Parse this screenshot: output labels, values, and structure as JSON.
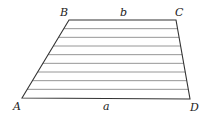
{
  "diagram": {
    "type": "trapezoid",
    "vertices": {
      "A": {
        "label": "A",
        "x": 22,
        "y": 98
      },
      "B": {
        "label": "B",
        "x": 69,
        "y": 20
      },
      "C": {
        "label": "C",
        "x": 176,
        "y": 20
      },
      "D": {
        "label": "D",
        "x": 190,
        "y": 99
      }
    },
    "sides": {
      "top": {
        "label": "b",
        "from": "B",
        "to": "C"
      },
      "bottom": {
        "label": "a",
        "from": "A",
        "to": "D"
      }
    },
    "interior_horizontal_lines": 8,
    "colors": {
      "edge": "#333333",
      "hatch": "#8a8a8a",
      "background": "#ffffff"
    }
  }
}
